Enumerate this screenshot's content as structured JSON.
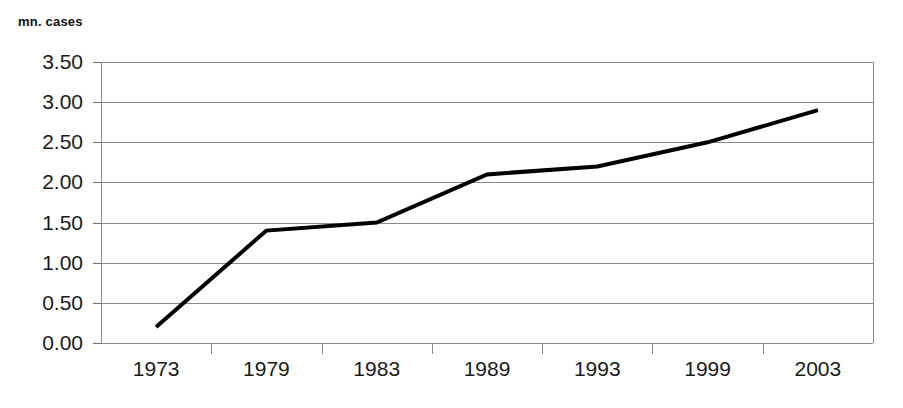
{
  "chart_data": {
    "type": "line",
    "title": "",
    "subtitle": "",
    "ylabel": "mn. cases",
    "xlabel": "",
    "categories": [
      "1973",
      "1979",
      "1983",
      "1989",
      "1993",
      "1999",
      "2003"
    ],
    "series": [
      {
        "name": "mn. cases",
        "values": [
          0.2,
          1.4,
          1.5,
          2.1,
          2.2,
          2.5,
          2.9
        ],
        "color": "#000000",
        "line_width": 4,
        "markers": false
      }
    ],
    "ylim": [
      0.0,
      3.5
    ],
    "ytick_step": 0.5,
    "ytick_labels": [
      "0.00",
      "0.50",
      "1.00",
      "1.50",
      "2.00",
      "2.50",
      "3.00",
      "3.50"
    ],
    "ytick_values": [
      0.0,
      0.5,
      1.0,
      1.5,
      2.0,
      2.5,
      3.0,
      3.5
    ],
    "grid": {
      "horizontal": true,
      "vertical": false,
      "color": "#8a8a8a"
    },
    "legend": {
      "visible": false,
      "position": "none"
    },
    "background": "#ffffff",
    "axis_color": "#8a8a8a",
    "tick_label_color": "#1a1a1a"
  }
}
